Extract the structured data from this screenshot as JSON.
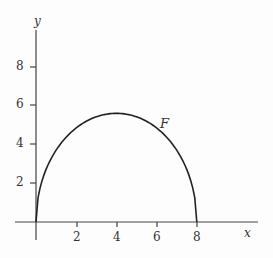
{
  "chart_data": {
    "type": "line",
    "title": "",
    "xlabel": "x",
    "ylabel": "y",
    "xlim": [
      0,
      9.5
    ],
    "ylim": [
      0,
      9.5
    ],
    "x_ticks": [
      "2",
      "4",
      "6",
      "8"
    ],
    "y_ticks": [
      "2",
      "4",
      "6",
      "8"
    ],
    "grid": false,
    "legend": null,
    "series": [
      {
        "name": "F",
        "x": [
          0,
          0.5,
          1,
          1.5,
          2,
          2.5,
          3,
          3.5,
          4,
          4.5,
          5,
          5.5,
          6,
          6.5,
          7,
          7.5,
          8
        ],
        "y": [
          0,
          2.71,
          3.7,
          4.38,
          4.85,
          5.19,
          5.42,
          5.56,
          5.6,
          5.56,
          5.42,
          5.19,
          4.85,
          4.38,
          3.7,
          2.71,
          0
        ]
      }
    ],
    "annotations": [
      {
        "text": "F",
        "x": 6.2,
        "y": 5.2
      }
    ]
  },
  "labels": {
    "x_axis": "x",
    "y_axis": "y",
    "curve": "F"
  }
}
